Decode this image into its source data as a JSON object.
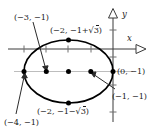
{
  "figure": {
    "kind": "coordinate-plane-ellipse-diagram",
    "axes": {
      "x_label": "x",
      "y_label": "y",
      "origin_px": [
        113,
        49
      ]
    },
    "ellipse": {
      "center": [
        -2,
        -1
      ],
      "center_px": [
        68.5,
        71.5
      ],
      "semi_axis_x_px": 44.5,
      "semi_axis_y_px": 31.5,
      "stroke": "#000000"
    },
    "horizontal_guide": {
      "y_value": -1,
      "stroke": "#b8b8b8"
    },
    "points": [
      {
        "id": "left-vertex",
        "label": "(−4, −1)",
        "px": [
          24.0,
          71.5
        ]
      },
      {
        "id": "focus-left",
        "label": "(−3, −1)",
        "px": [
          46.3,
          71.5
        ]
      },
      {
        "id": "center",
        "label": "",
        "px": [
          68.5,
          71.5
        ]
      },
      {
        "id": "focus-right",
        "label": "(−1, −1)",
        "px": [
          90.8,
          71.5
        ]
      },
      {
        "id": "right-vertex",
        "label": "(0, −1)",
        "px": [
          113.0,
          71.5
        ]
      },
      {
        "id": "top-vertex",
        "label": "(−2, −1+√3)",
        "px": [
          68.5,
          40.0
        ]
      },
      {
        "id": "bottom-vertex",
        "label": "(−2, −1−√3)",
        "px": [
          68.5,
          103.0
        ]
      }
    ],
    "labels": {
      "top_left": {
        "text_pre": "(−3, −1)",
        "x": 14,
        "y": 13
      },
      "top_vertex": {
        "text_pre": "(−2, −1+",
        "rad": "3",
        "text_post": ")",
        "x": 50,
        "y": 26
      },
      "right_vertex": {
        "text_pre": "(0, −1)",
        "x": 117,
        "y": 67
      },
      "right_lower": {
        "text_pre": "(−1, −1)",
        "x": 113,
        "y": 92
      },
      "bottom_vertex": {
        "text_pre": "(−2, −1−",
        "rad": "3",
        "text_post": ")",
        "x": 38,
        "y": 107
      },
      "bottom_left": {
        "text_pre": "(−4, −1)",
        "x": 4,
        "y": 118
      }
    },
    "leaders": [
      {
        "id": "leader-to-minus3",
        "from_px": [
          33,
          22
        ],
        "to_px": [
          46.3,
          70.0
        ]
      },
      {
        "id": "leader-to-minus4",
        "from_px": [
          16,
          114
        ],
        "to_px": [
          24.5,
          73.5
        ]
      },
      {
        "id": "leader-to-minus1",
        "from_px": [
          115,
          89
        ],
        "to_px": [
          91.5,
          73.0
        ]
      }
    ],
    "ticks": {
      "x_axis_px": [
        24,
        46,
        68,
        91
      ],
      "y_axis_px": [
        30,
        57,
        85,
        112
      ]
    }
  }
}
